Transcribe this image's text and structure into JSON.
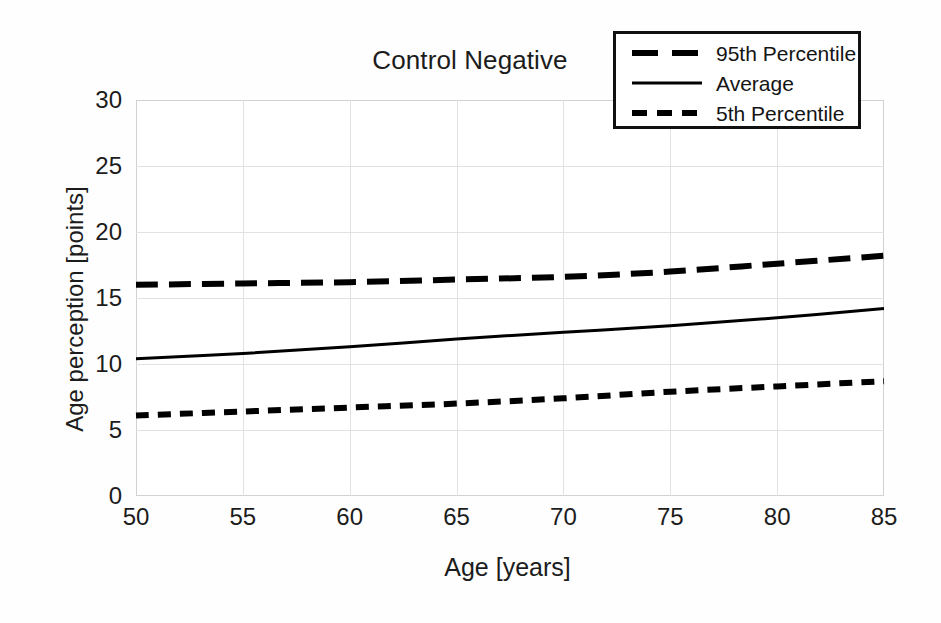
{
  "chart_data": {
    "type": "line",
    "title": "Control Negative",
    "xlabel": "Age [years]",
    "ylabel": "Age perception [points]",
    "xlim": [
      50,
      85
    ],
    "ylim": [
      0,
      30
    ],
    "xticks": [
      50,
      55,
      60,
      65,
      70,
      75,
      80,
      85
    ],
    "yticks": [
      0,
      5,
      10,
      15,
      20,
      25,
      30
    ],
    "grid": true,
    "legend_position": "top-right",
    "x": [
      50,
      55,
      60,
      65,
      70,
      75,
      80,
      85
    ],
    "series": [
      {
        "name": "95th Percentile",
        "style": "long-dashed",
        "color": "#000000",
        "values": [
          16.0,
          16.1,
          16.2,
          16.4,
          16.6,
          17.0,
          17.6,
          18.2
        ]
      },
      {
        "name": "Average",
        "style": "solid",
        "color": "#000000",
        "values": [
          10.4,
          10.8,
          11.3,
          11.9,
          12.4,
          12.9,
          13.5,
          14.2
        ]
      },
      {
        "name": "5th Percentile",
        "style": "short-dashed",
        "color": "#000000",
        "values": [
          6.1,
          6.4,
          6.7,
          7.0,
          7.4,
          7.9,
          8.3,
          8.7
        ]
      }
    ]
  },
  "legend": {
    "entries": [
      {
        "label": "95th Percentile"
      },
      {
        "label": "Average"
      },
      {
        "label": "5th Percentile"
      }
    ]
  },
  "colors": {
    "line": "#000000",
    "grid": "#e2e2e2",
    "frame": "#d2d2d2",
    "text": "#1c1c1c",
    "background": "#ffffff"
  }
}
